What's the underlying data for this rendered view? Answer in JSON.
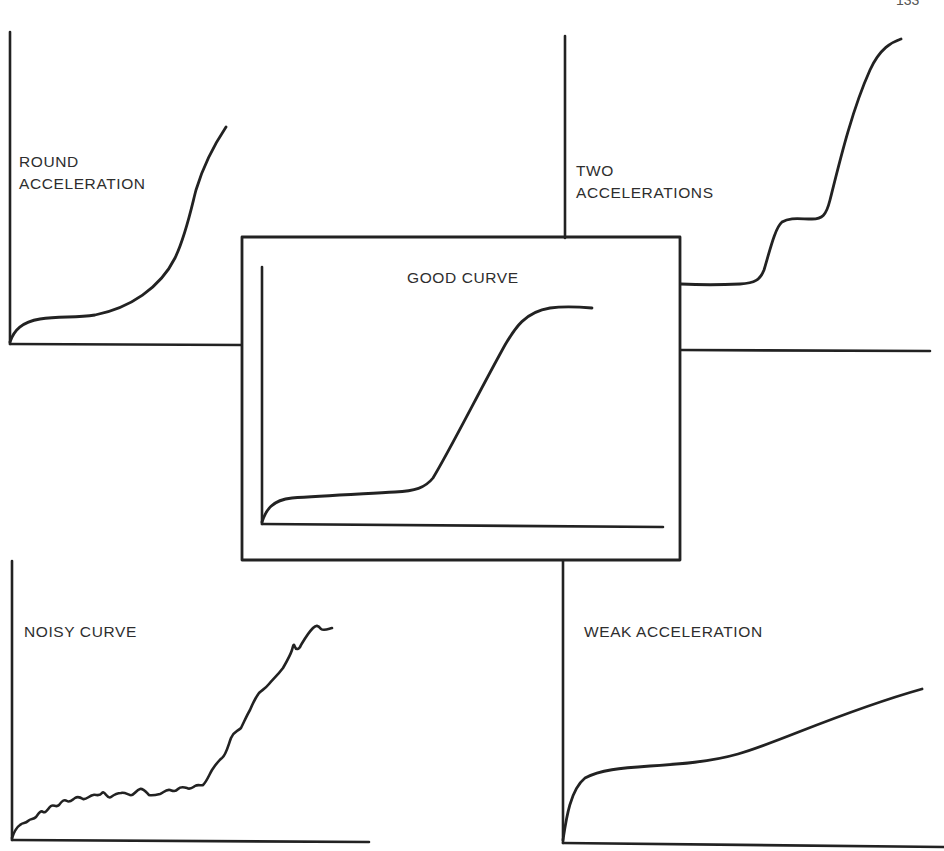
{
  "page": {
    "page_number": "133"
  },
  "figure": {
    "stroke_color": "#222222",
    "background": "#ffffff",
    "panels": [
      {
        "id": "round-acceleration",
        "position": "top-left",
        "title_lines": [
          "ROUND",
          "ACCELERATION"
        ],
        "description": "Flat initial rise, then gradual rounded upward curve"
      },
      {
        "id": "two-accelerations",
        "position": "top-right",
        "title_lines": [
          "TWO",
          "ACCELERATIONS"
        ],
        "description": "Flat, first step up to a plateau, then a second steep rise"
      },
      {
        "id": "good-curve",
        "position": "center (boxed)",
        "title_lines": [
          "GOOD CURVE"
        ],
        "description": "Flat baseline, sharp linear rise, then leveling plateau (sigmoid)"
      },
      {
        "id": "noisy-curve",
        "position": "bottom-left",
        "title_lines": [
          "NOISY CURVE"
        ],
        "description": "Wavy noisy baseline followed by a jagged rise"
      },
      {
        "id": "weak-acceleration",
        "position": "bottom-right",
        "title_lines": [
          "WEAK ACCELERATION"
        ],
        "description": "Quick initial rise, then only a gentle linear increase"
      }
    ]
  }
}
